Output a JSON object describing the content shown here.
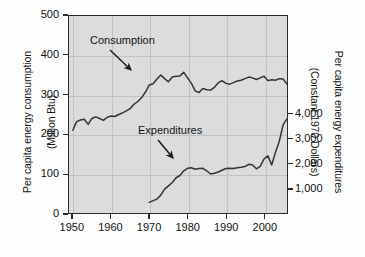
{
  "chart_data": {
    "type": "line",
    "title": "",
    "xlabel": "",
    "ylabel": "Per capita energy consumption\n(Million Btu)",
    "y2label": "Per capita energy expenditures\n(Constant 1970 Dollars)",
    "grid": true,
    "legend": "inline-annotations",
    "xlim": [
      1949,
      2006
    ],
    "ylim": [
      0,
      500
    ],
    "y2lim": [
      0,
      7930
    ],
    "xticks": [
      1950,
      1960,
      1970,
      1980,
      1990,
      2000
    ],
    "xticklabels": [
      "1950",
      "1960",
      "1970",
      "1980",
      "1990",
      "2000"
    ],
    "yticks": [
      0,
      100,
      200,
      300,
      400,
      500
    ],
    "yticklabels": [
      "0",
      "100",
      "200",
      "300",
      "400",
      "500"
    ],
    "y2ticks": [
      1000,
      2000,
      3000,
      4000
    ],
    "y2ticklabels": [
      "1,000",
      "2,000",
      "3,000",
      "4,000"
    ],
    "annotations": [
      {
        "text": "Consumption",
        "points_to_series": "Consumption"
      },
      {
        "text": "Expenditures",
        "points_to_series": "Expenditures"
      }
    ],
    "series": [
      {
        "name": "Consumption",
        "axis": "left",
        "units": "Million Btu",
        "x": [
          1950,
          1951,
          1952,
          1953,
          1954,
          1955,
          1956,
          1957,
          1958,
          1959,
          1960,
          1961,
          1962,
          1963,
          1964,
          1965,
          1966,
          1967,
          1968,
          1969,
          1970,
          1971,
          1972,
          1973,
          1974,
          1975,
          1976,
          1977,
          1978,
          1979,
          1980,
          1981,
          1982,
          1983,
          1984,
          1985,
          1986,
          1987,
          1988,
          1989,
          1990,
          1991,
          1992,
          1993,
          1994,
          1995,
          1996,
          1997,
          1998,
          1999,
          2000,
          2001,
          2002,
          2003,
          2004,
          2005,
          2006
        ],
        "values": [
          210,
          232,
          236,
          238,
          225,
          240,
          244,
          240,
          235,
          243,
          246,
          245,
          250,
          254,
          259,
          265,
          276,
          283,
          293,
          307,
          325,
          328,
          340,
          350,
          341,
          333,
          345,
          347,
          348,
          357,
          343,
          329,
          310,
          306,
          316,
          313,
          312,
          319,
          330,
          336,
          329,
          327,
          331,
          335,
          337,
          341,
          345,
          343,
          339,
          343,
          347,
          336,
          338,
          337,
          341,
          340,
          327
        ]
      },
      {
        "name": "Expenditures",
        "axis": "right",
        "units": "Constant 1970 Dollars",
        "x": [
          1970,
          1971,
          1972,
          1973,
          1974,
          1975,
          1976,
          1977,
          1978,
          1979,
          1980,
          1981,
          1982,
          1983,
          1984,
          1985,
          1986,
          1987,
          1988,
          1989,
          1990,
          1991,
          1992,
          1993,
          1994,
          1995,
          1996,
          1997,
          1998,
          1999,
          2000,
          2001,
          2002,
          2003,
          2004,
          2005,
          2006
        ],
        "values": [
          430,
          500,
          560,
          720,
          960,
          1090,
          1230,
          1420,
          1510,
          1700,
          1800,
          1820,
          1760,
          1790,
          1800,
          1700,
          1570,
          1600,
          1650,
          1720,
          1790,
          1800,
          1790,
          1820,
          1840,
          1870,
          1960,
          1930,
          1780,
          1880,
          2180,
          2300,
          1930,
          2450,
          2900,
          3560,
          3790
        ]
      }
    ]
  },
  "axes": {
    "left_title_line1": "Per capita energy consumption",
    "left_title_line2": "(Million Btu)",
    "right_title_line1": "Per capita energy expenditures",
    "right_title_line2": "(Constant 1970 Dollars)"
  },
  "labels": {
    "consumption": "Consumption",
    "expenditures": "Expenditures"
  },
  "ticks": {
    "left": [
      "500",
      "400",
      "300",
      "200",
      "100",
      "0"
    ],
    "right": [
      "4,000",
      "3,000",
      "2,000",
      "1,000"
    ],
    "bottom": [
      "1950",
      "1960",
      "1970",
      "1980",
      "1990",
      "2000"
    ]
  },
  "colors": {
    "plot_background": "#dcdcdc",
    "figure_background": "#fdfdfd",
    "line": "#333333",
    "grid": "#c2c2c2",
    "axis": "#2b2b2b",
    "text": "#111111"
  }
}
